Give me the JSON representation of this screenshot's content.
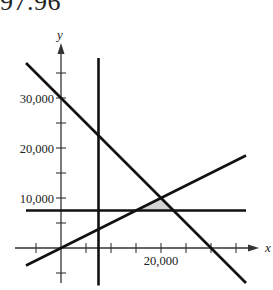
{
  "header": {
    "text": "97.96"
  },
  "chart_data": {
    "type": "line",
    "title": "",
    "xlabel": "x",
    "ylabel": "y",
    "xlim": [
      -10000,
      38000
    ],
    "ylim": [
      -7000,
      40000
    ],
    "grid": false,
    "x_tick_step": 5000,
    "y_tick_step": 5000,
    "x_tick_labels": [
      {
        "value": 20000,
        "label": "20,000"
      }
    ],
    "y_tick_labels": [
      {
        "value": 30000,
        "label": "30,000"
      },
      {
        "value": 20000,
        "label": "20,000"
      },
      {
        "value": 10000,
        "label": "10,000"
      }
    ],
    "series": [
      {
        "name": "x + y = 30000",
        "kind": "line",
        "points": [
          [
            -7000,
            37000
          ],
          [
            37000,
            -7000
          ]
        ]
      },
      {
        "name": "x = 7500",
        "kind": "vertical",
        "points": [
          [
            7500,
            38000
          ],
          [
            7500,
            -7500
          ]
        ]
      },
      {
        "name": "y = x/2",
        "kind": "line",
        "points": [
          [
            -7000,
            -3500
          ],
          [
            37000,
            18500
          ]
        ]
      },
      {
        "name": "y = 7500",
        "kind": "horizontal",
        "points": [
          [
            -7000,
            7500
          ],
          [
            37000,
            7500
          ]
        ]
      }
    ],
    "shaded_region": {
      "description": "feasible region",
      "vertices": [
        [
          15000,
          7500
        ],
        [
          20000,
          10000
        ],
        [
          22500,
          7500
        ]
      ],
      "color": "#d4d4d4"
    }
  },
  "colors": {
    "line": "#111111",
    "axis": "#333333",
    "shade": "#d4d4d4"
  }
}
